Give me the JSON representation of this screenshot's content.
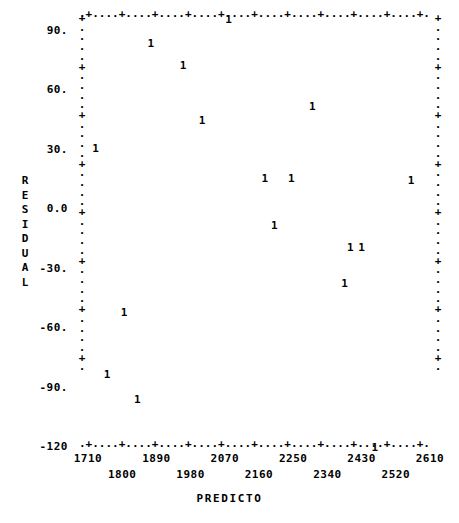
{
  "chart_data": {
    "type": "scatter",
    "title": "",
    "subtitle": "",
    "xlabel": "PREDICTO",
    "ylabel": "RESIDUAL",
    "ylabel_chars": [
      "R",
      "E",
      "S",
      "I",
      "D",
      "U",
      "A",
      "L"
    ],
    "point_glyph": "1",
    "glyph_meaning": "count of 1 observation at this location",
    "grid": false,
    "legend": null,
    "xlim": [
      1665,
      2655
    ],
    "ylim": [
      -135,
      105
    ],
    "xticks": [
      1710,
      1800,
      1890,
      1980,
      2070,
      2160,
      2250,
      2340,
      2430,
      2520,
      2610
    ],
    "xtick_labels": [
      "1710",
      "1800",
      "1890",
      "1980",
      "2070",
      "2160",
      "2250",
      "2340",
      "2430",
      "2520",
      "2610"
    ],
    "yticks": [
      90,
      60,
      30,
      0,
      -30,
      -60,
      -90,
      -120
    ],
    "ytick_labels": [
      "90.",
      "60.",
      "30.",
      "0.0",
      "-30.",
      "-60.",
      "-90.",
      "-120"
    ],
    "x": [
      1730,
      1875,
      1960,
      2080,
      2010,
      2300,
      2175,
      2245,
      2290,
      2560,
      2200,
      2400,
      2430,
      2385,
      1805,
      1760,
      1840,
      2465
    ],
    "y": [
      30,
      83,
      72,
      95,
      44,
      51,
      15,
      15,
      15,
      14,
      -9,
      -20,
      -20,
      -38,
      -53,
      -84,
      -97,
      -121
    ],
    "points": [
      {
        "x": 1730,
        "y": 30,
        "label": "1"
      },
      {
        "x": 1875,
        "y": 83,
        "label": "1"
      },
      {
        "x": 1960,
        "y": 72,
        "label": "1"
      },
      {
        "x": 2080,
        "y": 95,
        "label": "1"
      },
      {
        "x": 2010,
        "y": 44,
        "label": "1"
      },
      {
        "x": 2300,
        "y": 51,
        "label": "1"
      },
      {
        "x": 2175,
        "y": 15,
        "label": "1"
      },
      {
        "x": 2245,
        "y": 15,
        "label": "1"
      },
      {
        "x": 2560,
        "y": 14,
        "label": "1"
      },
      {
        "x": 2200,
        "y": -9,
        "label": "1"
      },
      {
        "x": 2400,
        "y": -20,
        "label": "1"
      },
      {
        "x": 2430,
        "y": -20,
        "label": "1"
      },
      {
        "x": 2385,
        "y": -38,
        "label": "1"
      },
      {
        "x": 1805,
        "y": -53,
        "label": "1"
      },
      {
        "x": 1760,
        "y": -84,
        "label": "1"
      },
      {
        "x": 1840,
        "y": -97,
        "label": "1"
      },
      {
        "x": 2465,
        "y": -121,
        "label": "1"
      }
    ]
  },
  "axes": {
    "top_row": ".+....+....+....+....+....+....+....+....+....+....+.",
    "bottom_row": ".+....+....+....+....+....+....+....+....+....+....+.",
    "left_col": "+....+....+....+....+....+....+....+.",
    "right_col": "+....+....+....+....+....+....+....+."
  },
  "colors": {
    "ink": "#000000",
    "background": "#ffffff"
  }
}
